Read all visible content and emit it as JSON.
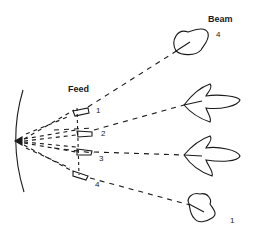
{
  "labels": {
    "beam": "Beam",
    "feed": "Feed"
  },
  "feeds": [
    {
      "id": "1",
      "label": "1"
    },
    {
      "id": "2",
      "label": "2"
    },
    {
      "id": "3",
      "label": "3"
    },
    {
      "id": "4",
      "label": "4"
    }
  ],
  "beams": [
    {
      "id": "4",
      "label": "4",
      "shape": "rounded-lobe"
    },
    {
      "id": "3",
      "label": "",
      "shape": "arrow-lobe"
    },
    {
      "id": "2",
      "label": "",
      "shape": "arrow-lobe"
    },
    {
      "id": "1",
      "label": "1",
      "shape": "rounded-lobe"
    }
  ],
  "colors": {
    "line": "#1a1a1a",
    "background": "#ffffff"
  }
}
